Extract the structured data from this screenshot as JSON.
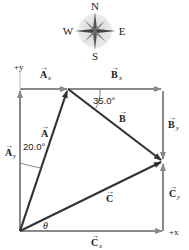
{
  "compass": {
    "north": "N",
    "south": "S",
    "east": "E",
    "west": "W"
  },
  "axes": {
    "x_label": "+x",
    "y_label": "+y"
  },
  "vectors": {
    "A": {
      "symbol": "A",
      "subscript": ""
    },
    "Ax": {
      "symbol": "A",
      "subscript": "x"
    },
    "Ay": {
      "symbol": "A",
      "subscript": "y"
    },
    "B": {
      "symbol": "B",
      "subscript": ""
    },
    "Bx": {
      "symbol": "B",
      "subscript": "x"
    },
    "By": {
      "symbol": "B",
      "subscript": "y"
    },
    "C": {
      "symbol": "C",
      "subscript": ""
    },
    "Cx": {
      "symbol": "C",
      "subscript": "x"
    },
    "Cy": {
      "symbol": "C",
      "subscript": "y"
    }
  },
  "angles": {
    "a_angle": "20.0°",
    "b_angle": "35.0°",
    "c_angle": "θ"
  },
  "colors": {
    "component": "#8a8a8a",
    "resultant": "#333333",
    "compass_bg": "#e6e6e6"
  }
}
